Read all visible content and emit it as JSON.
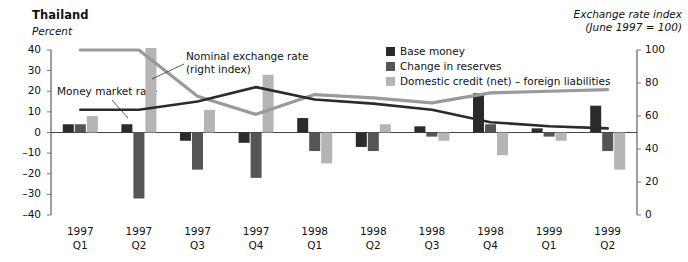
{
  "title": "Thailand",
  "left_axis_label": "Percent",
  "right_axis_title_line1": "Exchange rate index",
  "right_axis_title_line2": "(June 1997 = 100)",
  "annotations": [
    {
      "name": "nominal-exchange-rate",
      "line1": "Nominal exchange rate",
      "line2": "(right index)"
    },
    {
      "name": "money-market-rate",
      "line1": "Money market rate",
      "line2": ""
    }
  ],
  "legend": [
    {
      "label": "Base money",
      "color": "#2b2b2b"
    },
    {
      "label": "Change in reserves",
      "color": "#555555"
    },
    {
      "label": "Domestic credit (net) – foreign liabilities",
      "color": "#b5b5b5"
    }
  ],
  "chart_data": {
    "type": "bar",
    "title": "Thailand",
    "xlabel": "",
    "ylabel": "Percent",
    "y2label": "Exchange rate index (June 1997 = 100)",
    "ylim": [
      -40,
      40
    ],
    "y2lim": [
      0,
      100
    ],
    "yticks": [
      40,
      30,
      20,
      10,
      0,
      -10,
      -20,
      -30,
      -40
    ],
    "y2ticks": [
      100,
      80,
      60,
      40,
      20,
      0
    ],
    "grid": false,
    "legend_position": "top-center",
    "categories": [
      "1997 Q1",
      "1997 Q2",
      "1997 Q3",
      "1997 Q4",
      "1998 Q1",
      "1998 Q2",
      "1998 Q3",
      "1998 Q4",
      "1999 Q1",
      "1999 Q2"
    ],
    "category_years": [
      "1997",
      "1997",
      "1997",
      "1997",
      "1998",
      "1998",
      "1998",
      "1998",
      "1999",
      "1999"
    ],
    "category_quarters": [
      "Q1",
      "Q2",
      "Q3",
      "Q4",
      "Q1",
      "Q2",
      "Q3",
      "Q4",
      "Q1",
      "Q2"
    ],
    "series": [
      {
        "name": "Base money",
        "type": "bar",
        "axis": "left",
        "color": "#2b2b2b",
        "values": [
          4,
          4,
          -4,
          -5,
          7,
          -7,
          3,
          19,
          2,
          13
        ]
      },
      {
        "name": "Change in reserves",
        "type": "bar",
        "axis": "left",
        "color": "#555555",
        "values": [
          4,
          -32,
          -18,
          -22,
          -9,
          -9,
          -2,
          4,
          -2,
          -9
        ]
      },
      {
        "name": "Domestic credit (net) – foreign liabilities",
        "type": "bar",
        "axis": "left",
        "color": "#b5b5b5",
        "values": [
          8,
          41,
          11,
          28,
          -15,
          4,
          -4,
          -11,
          -4,
          -18
        ]
      },
      {
        "name": "Nominal exchange rate (right index)",
        "type": "line",
        "axis": "right",
        "color": "#9a9a9a",
        "values": [
          100,
          100,
          72,
          61,
          73,
          71,
          68,
          74,
          75,
          76
        ]
      },
      {
        "name": "Money market rate",
        "type": "line",
        "axis": "left",
        "color": "#2b2b2b",
        "values": [
          11,
          11,
          15,
          22,
          16,
          14,
          11,
          5,
          3,
          2
        ]
      }
    ]
  }
}
